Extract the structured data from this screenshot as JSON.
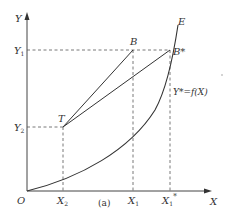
{
  "figure": {
    "caption": "(a)",
    "axes": {
      "y_label": "Y",
      "x_label": "X",
      "origin_label": "O"
    },
    "y_ticks": [
      {
        "label": "Y",
        "sub": "1"
      },
      {
        "label": "Y",
        "sub": "2"
      }
    ],
    "x_ticks": [
      {
        "label": "X",
        "sub": "2"
      },
      {
        "label": "X",
        "sub": "1"
      },
      {
        "label": "X",
        "sub": "1",
        "sup": "*"
      }
    ],
    "points": {
      "T": "T",
      "B": "B",
      "B_star": "B*",
      "E": "E"
    },
    "curve_label": "Y*=f(X)",
    "colors": {
      "line": "#333333",
      "dashed": "#555555",
      "background": "#ffffff"
    }
  }
}
